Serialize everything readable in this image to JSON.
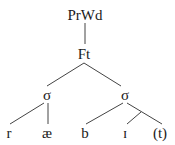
{
  "tree": {
    "root": {
      "label": "PrWd",
      "x": 85,
      "y": 15
    },
    "foot": {
      "label": "Ft",
      "x": 84,
      "y": 54
    },
    "syllables": [
      {
        "label": "σ",
        "x": 47,
        "y": 95
      },
      {
        "label": "σ",
        "x": 125,
        "y": 95
      }
    ],
    "segments": [
      {
        "label": "r",
        "x": 9,
        "y": 133
      },
      {
        "label": "æ",
        "x": 47,
        "y": 133
      },
      {
        "label": "b",
        "x": 85,
        "y": 133
      },
      {
        "label": "ɪ",
        "x": 125,
        "y": 133
      },
      {
        "label": "(t)",
        "x": 160,
        "y": 133
      }
    ]
  },
  "colors": {
    "line": "#444444",
    "text": "#1a1a1a",
    "background": "#ffffff"
  }
}
